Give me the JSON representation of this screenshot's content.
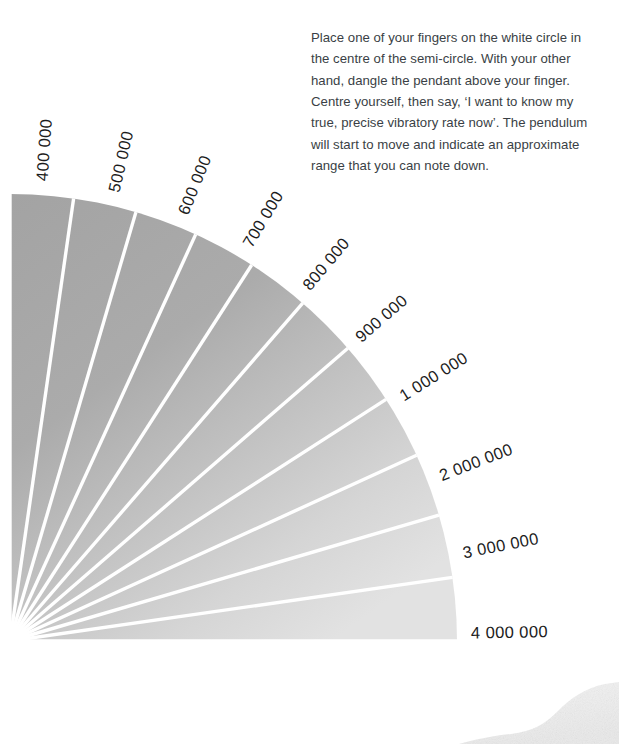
{
  "page": {
    "width": 619,
    "height": 744,
    "background": "#ffffff"
  },
  "instructions": {
    "text": "Place one of your fingers on the white circle in the centre of the semi-circle. With your other hand, dangle the pendant above your finger. Centre yourself, then say, ‘I want to know my true, precise vibratory rate now’. The pendulum will start to move and indicate an approximate range that you can note down.",
    "color": "#3a3f45"
  },
  "chart_data": {
    "type": "pie",
    "title": "",
    "subtitle": "",
    "xlabel": "",
    "ylabel": "",
    "legend_position": "radial-outside",
    "grid": false,
    "center": {
      "x": 10,
      "y": 641
    },
    "radius": 447,
    "start_angle_deg": -90,
    "end_angle_deg": 0,
    "sector_count": 11,
    "colors": {
      "sector_dark": "#a4a4a4",
      "sector_light": "#e0e0e0",
      "divider": "#ffffff",
      "label": "#1c1c1c"
    },
    "categories": [
      "400 000",
      "500 000",
      "600 000",
      "700 000",
      "800 000",
      "900 000",
      "1 000 000",
      "2 000 000",
      "3 000 000",
      "4 000 000"
    ],
    "values": [
      400000,
      500000,
      600000,
      700000,
      800000,
      900000,
      1000000,
      2000000,
      3000000,
      4000000
    ],
    "labels": [
      {
        "text": "400 000",
        "angle_deg": -86,
        "clipped": true
      },
      {
        "text": "500 000",
        "angle_deg": -77,
        "clipped": false
      },
      {
        "text": "600 000",
        "angle_deg": -68,
        "clipped": false
      },
      {
        "text": "700 000",
        "angle_deg": -59,
        "clipped": false
      },
      {
        "text": "800 000",
        "angle_deg": -50,
        "clipped": false
      },
      {
        "text": "900 000",
        "angle_deg": -41,
        "clipped": false
      },
      {
        "text": "1 000 000",
        "angle_deg": -32,
        "clipped": false
      },
      {
        "text": "2 000 000",
        "angle_deg": -21,
        "clipped": false
      },
      {
        "text": "3 000 000",
        "angle_deg": -11,
        "clipped": false
      },
      {
        "text": "4 000 000",
        "angle_deg": -1,
        "clipped": false
      }
    ]
  },
  "decor": {
    "stone_blob_name": "textured-stone-edge"
  }
}
